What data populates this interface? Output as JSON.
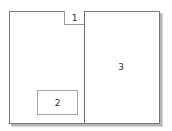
{
  "diagram": {
    "type": "panel-layout",
    "regions": [
      {
        "id": "1",
        "label": "1"
      },
      {
        "id": "2",
        "label": "2"
      },
      {
        "id": "3",
        "label": "3"
      }
    ]
  }
}
